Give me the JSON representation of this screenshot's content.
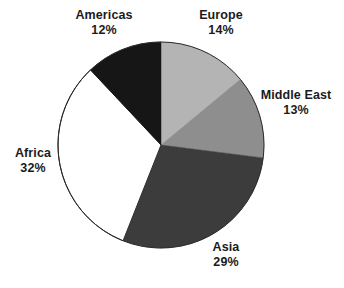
{
  "chart_data": {
    "type": "pie",
    "title": "",
    "subtitle": "",
    "xlabel": "",
    "ylabel": "",
    "units": "percent",
    "total": 100,
    "legend_position": "none",
    "label_format": "name + percent",
    "start_angle_deg": 0,
    "direction": "clockwise",
    "grid": false,
    "categories": [
      "Europe",
      "Middle East",
      "Asia",
      "Africa",
      "Americas"
    ],
    "values": [
      14,
      13,
      29,
      32,
      12
    ],
    "slices": [
      {
        "name": "Europe",
        "value": 14,
        "percent_label": "14%",
        "color": "#b4b4b4"
      },
      {
        "name": "Middle East",
        "value": 13,
        "percent_label": "13%",
        "color": "#8e8e8e"
      },
      {
        "name": "Asia",
        "value": 29,
        "percent_label": "29%",
        "color": "#3c3c3c"
      },
      {
        "name": "Africa",
        "value": 32,
        "percent_label": "32%",
        "color": "#ffffff"
      },
      {
        "name": "Americas",
        "value": 12,
        "percent_label": "12%",
        "color": "#161616"
      }
    ]
  },
  "labels": {
    "europe": {
      "name": "Europe",
      "value": "14%"
    },
    "middle_east": {
      "name": "Middle East",
      "value": "13%"
    },
    "asia": {
      "name": "Asia",
      "value": "29%"
    },
    "africa": {
      "name": "Africa",
      "value": "32%"
    },
    "americas": {
      "name": "Americas",
      "value": "12%"
    }
  },
  "style": {
    "background": "#ffffff",
    "outline": "#2a2a2a",
    "text": "#1b1b1b"
  }
}
